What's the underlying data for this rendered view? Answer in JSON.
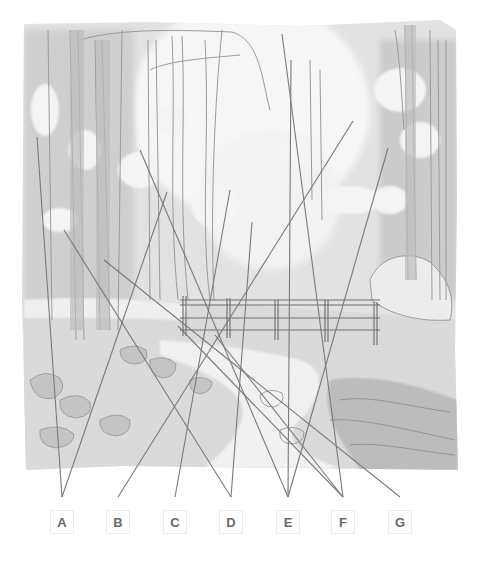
{
  "figure": {
    "labels": [
      {
        "letter": "A",
        "x": 62,
        "targets": [
          [
            37,
            137
          ],
          [
            167,
            192
          ]
        ]
      },
      {
        "letter": "B",
        "x": 118,
        "targets": [
          [
            353,
            121
          ]
        ]
      },
      {
        "letter": "C",
        "x": 175,
        "targets": [
          [
            230,
            190
          ]
        ]
      },
      {
        "letter": "D",
        "x": 231,
        "targets": [
          [
            64,
            230
          ],
          [
            252,
            222
          ]
        ]
      },
      {
        "letter": "E",
        "x": 288,
        "targets": [
          [
            140,
            150
          ],
          [
            291,
            60
          ],
          [
            388,
            148
          ]
        ]
      },
      {
        "letter": "F",
        "x": 343,
        "targets": [
          [
            282,
            34
          ],
          [
            178,
            326
          ],
          [
            215,
            335
          ]
        ]
      },
      {
        "letter": "G",
        "x": 400,
        "targets": [
          [
            104,
            260
          ]
        ]
      }
    ],
    "line_end_y": 497,
    "box_center_y": 522,
    "line_color": "#7a7a7a"
  }
}
